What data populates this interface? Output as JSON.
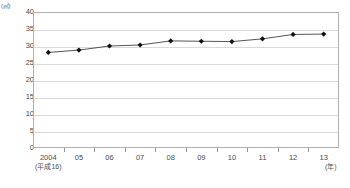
{
  "chart_data": {
    "type": "line",
    "title": "",
    "subtitle": "",
    "xlabel": "(年)",
    "ylabel": "(㎡)",
    "ylim": [
      0,
      40
    ],
    "ytick_step": 5,
    "yticks": [
      40,
      35,
      30,
      25,
      20,
      15,
      10,
      5,
      0
    ],
    "grid": true,
    "legend": false,
    "categories": [
      "2004",
      "05",
      "06",
      "07",
      "08",
      "09",
      "10",
      "11",
      "12",
      "13"
    ],
    "category_sublabels": [
      "(平成16)",
      "",
      "",
      "",
      "",
      "",
      "",
      "",
      "",
      ""
    ],
    "series": [
      {
        "name": "面積",
        "values": [
          28.1,
          28.8,
          30.0,
          30.3,
          31.5,
          31.4,
          31.3,
          32.1,
          33.4,
          33.5
        ]
      }
    ],
    "marker": "diamond",
    "line_color": "#555555",
    "marker_color": "#111111"
  },
  "axes": {
    "y_unit_label": "(㎡)",
    "x_unit_label": "(年)"
  },
  "caption": {
    "text": ""
  }
}
